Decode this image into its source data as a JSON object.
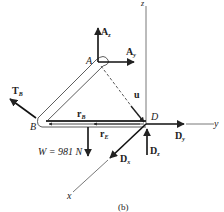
{
  "figure": {
    "caption": "(b)",
    "axes": {
      "x": "x",
      "y": "y",
      "z": "z"
    },
    "points": {
      "A": "A",
      "B": "B",
      "D": "D"
    },
    "forces": {
      "Az": {
        "symbol": "A",
        "sub": "z"
      },
      "Ay": {
        "symbol": "A",
        "sub": "y"
      },
      "TB": {
        "symbol": "T",
        "sub": "B"
      },
      "Dx": {
        "symbol": "D",
        "sub": "x"
      },
      "Dy": {
        "symbol": "D",
        "sub": "y"
      },
      "Dz": {
        "symbol": "D",
        "sub": "z"
      },
      "W": {
        "label": "W = 981 N"
      }
    },
    "vectors": {
      "u": "u",
      "rB": {
        "symbol": "r",
        "sub": "B"
      },
      "rE": {
        "symbol": "r",
        "sub": "E"
      }
    },
    "colors": {
      "line": "#222222",
      "background": "#ffffff"
    }
  }
}
